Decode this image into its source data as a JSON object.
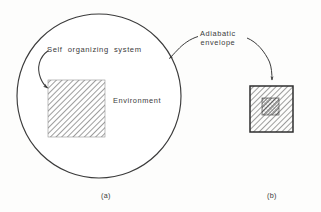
{
  "figure": {
    "kind": "scientific-line-diagram",
    "background_color": "#fdfdfc",
    "ink_color": "#3b3b3b",
    "panels": [
      {
        "caption": "(a)",
        "shape": "circle",
        "contains": "hatched square"
      },
      {
        "caption": "(b)",
        "shape": "bordered hatched square",
        "contains": "smaller hatched square"
      }
    ]
  },
  "labels": {
    "self_organizing_system": "Self organizing system",
    "environment": "Environment",
    "adiabatic_line1": "Adiabatic",
    "adiabatic_line2": "envelope",
    "caption_a": "(a)",
    "caption_b": "(b)"
  },
  "geometry": {
    "circle": {
      "cx": 99,
      "cy": 96,
      "r": 82
    },
    "square_a": {
      "x": 48,
      "y": 80,
      "w": 57,
      "h": 57
    },
    "square_b_outer": {
      "x": 250,
      "y": 86,
      "w": 43,
      "h": 46
    },
    "square_b_inner": {
      "x": 262,
      "y": 98,
      "w": 17,
      "h": 17
    }
  },
  "colors": {
    "ink": "#3b3b3b",
    "hatch": "#6e6e6e",
    "hatch_dark": "#4a4a4a",
    "border": "#2e2e2e",
    "paper": "#fdfdfc"
  }
}
